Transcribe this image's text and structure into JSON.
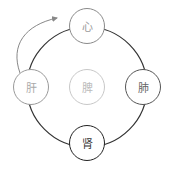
{
  "diagram": {
    "type": "five-organ cycle",
    "nodes": [
      {
        "id": "heart",
        "label": "心",
        "x": 87,
        "y": 26,
        "border": "#8a8a8a",
        "text": "#9a9a9a",
        "width": 1
      },
      {
        "id": "liver",
        "label": "肝",
        "x": 31,
        "y": 87,
        "border": "#9a9a9a",
        "text": "#aaaaaa",
        "width": 1
      },
      {
        "id": "lung",
        "label": "肺",
        "x": 143,
        "y": 87,
        "border": "#555555",
        "text": "#666666",
        "width": 1.2
      },
      {
        "id": "kidney",
        "label": "肾",
        "x": 87,
        "y": 143,
        "border": "#222222",
        "text": "#333333",
        "width": 1.6
      },
      {
        "id": "spleen",
        "label": "脾",
        "x": 87,
        "y": 87,
        "border": "#c8c8c8",
        "text": "#bbbbbb",
        "width": 1
      }
    ],
    "edges": [
      {
        "from": "liver",
        "to": "heart",
        "style": "arrow",
        "color": "#888888"
      }
    ],
    "ring": {
      "cx": 87,
      "cy": 87,
      "r": 60,
      "color": "#333333"
    }
  }
}
